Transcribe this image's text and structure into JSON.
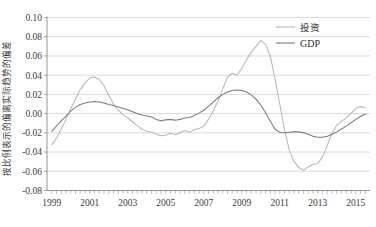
{
  "chart_data": {
    "type": "line",
    "title": "",
    "xlabel": "",
    "ylabel": "按比例表示的偏离实际趋势的偏差",
    "xlim": [
      1998.75,
      2015.75
    ],
    "ylim": [
      -0.08,
      0.1
    ],
    "grid": true,
    "legend_position": "top-right",
    "x_tick_labels": [
      "1999",
      "2001",
      "2003",
      "2005",
      "2007",
      "2009",
      "2011",
      "2013",
      "2015"
    ],
    "x_tick_values": [
      1999,
      2001,
      2003,
      2005,
      2007,
      2009,
      2011,
      2013,
      2015
    ],
    "y_tick_labels": [
      "0.10",
      "0.08",
      "0.06",
      "0.04",
      "0.02",
      "0.00",
      "-0.02",
      "-0.04",
      "-0.06",
      "-0.08"
    ],
    "y_tick_values": [
      0.1,
      0.08,
      0.06,
      0.04,
      0.02,
      0.0,
      -0.02,
      -0.04,
      -0.06,
      -0.08
    ],
    "x_minor_tick_interval": 0.25,
    "colors": {
      "investment": "#b6b6b6",
      "gdp": "#7a7a7a",
      "grid": "#c9c9c9",
      "axis": "#8a8a8a"
    },
    "series": [
      {
        "name": "投资",
        "color": "#b6b6b6",
        "x": [
          1999.0,
          1999.25,
          1999.5,
          1999.75,
          2000.0,
          2000.25,
          2000.5,
          2000.75,
          2001.0,
          2001.25,
          2001.5,
          2001.75,
          2002.0,
          2002.25,
          2002.5,
          2002.75,
          2003.0,
          2003.25,
          2003.5,
          2003.75,
          2004.0,
          2004.25,
          2004.5,
          2004.75,
          2005.0,
          2005.25,
          2005.5,
          2005.75,
          2006.0,
          2006.25,
          2006.5,
          2006.75,
          2007.0,
          2007.25,
          2007.5,
          2007.75,
          2008.0,
          2008.25,
          2008.5,
          2008.75,
          2009.0,
          2009.25,
          2009.5,
          2009.75,
          2010.0,
          2010.25,
          2010.5,
          2010.75,
          2011.0,
          2011.25,
          2011.5,
          2011.75,
          2012.0,
          2012.25,
          2012.5,
          2012.75,
          2013.0,
          2013.25,
          2013.5,
          2013.75,
          2014.0,
          2014.25,
          2014.5,
          2014.75,
          2015.0,
          2015.25,
          2015.5
        ],
        "y": [
          -0.0325,
          -0.0255,
          -0.016,
          -0.006,
          0.005,
          0.015,
          0.025,
          0.032,
          0.037,
          0.038,
          0.0355,
          0.029,
          0.019,
          0.01,
          0.0035,
          -0.001,
          -0.0045,
          -0.0085,
          -0.0125,
          -0.016,
          -0.0185,
          -0.0195,
          -0.0215,
          -0.023,
          -0.0225,
          -0.0205,
          -0.022,
          -0.02,
          -0.0175,
          -0.0195,
          -0.0165,
          -0.0155,
          -0.013,
          -0.006,
          0.003,
          0.013,
          0.0255,
          0.038,
          0.042,
          0.04,
          0.047,
          0.056,
          0.064,
          0.07,
          0.076,
          0.072,
          0.06,
          0.036,
          0.01,
          -0.017,
          -0.038,
          -0.05,
          -0.056,
          -0.059,
          -0.0555,
          -0.053,
          -0.052,
          -0.045,
          -0.033,
          -0.0205,
          -0.012,
          -0.008,
          -0.0045,
          0.0,
          0.0055,
          0.0075,
          0.006
        ]
      },
      {
        "name": "GDP",
        "color": "#7a7a7a",
        "x": [
          1999.0,
          1999.25,
          1999.5,
          1999.75,
          2000.0,
          2000.25,
          2000.5,
          2000.75,
          2001.0,
          2001.25,
          2001.5,
          2001.75,
          2002.0,
          2002.25,
          2002.5,
          2002.75,
          2003.0,
          2003.25,
          2003.5,
          2003.75,
          2004.0,
          2004.25,
          2004.5,
          2004.75,
          2005.0,
          2005.25,
          2005.5,
          2005.75,
          2006.0,
          2006.25,
          2006.5,
          2006.75,
          2007.0,
          2007.25,
          2007.5,
          2007.75,
          2008.0,
          2008.25,
          2008.5,
          2008.75,
          2009.0,
          2009.25,
          2009.5,
          2009.75,
          2010.0,
          2010.25,
          2010.5,
          2010.75,
          2011.0,
          2011.25,
          2011.5,
          2011.75,
          2012.0,
          2012.25,
          2012.5,
          2012.75,
          2013.0,
          2013.25,
          2013.5,
          2013.75,
          2014.0,
          2014.25,
          2014.5,
          2014.75,
          2015.0,
          2015.25,
          2015.5
        ],
        "y": [
          -0.0185,
          -0.013,
          -0.0075,
          -0.0025,
          0.0025,
          0.0065,
          0.0095,
          0.011,
          0.012,
          0.0125,
          0.012,
          0.011,
          0.0095,
          0.0085,
          0.007,
          0.0055,
          0.004,
          0.002,
          0.0,
          -0.0015,
          -0.0025,
          -0.0035,
          -0.006,
          -0.0075,
          -0.0065,
          -0.006,
          -0.007,
          -0.006,
          -0.0045,
          -0.004,
          -0.002,
          0.0005,
          0.0035,
          0.0075,
          0.012,
          0.0165,
          0.02,
          0.0225,
          0.024,
          0.0245,
          0.024,
          0.0225,
          0.0195,
          0.015,
          0.009,
          0.001,
          -0.008,
          -0.016,
          -0.0195,
          -0.02,
          -0.0195,
          -0.019,
          -0.019,
          -0.02,
          -0.0215,
          -0.0235,
          -0.0245,
          -0.0245,
          -0.0235,
          -0.0215,
          -0.019,
          -0.016,
          -0.013,
          -0.0095,
          -0.006,
          -0.003,
          -0.0005
        ]
      }
    ],
    "legend_entries": [
      {
        "label": "投资",
        "color": "#b6b6b6"
      },
      {
        "label": "GDP",
        "color": "#7a7a7a"
      }
    ]
  }
}
